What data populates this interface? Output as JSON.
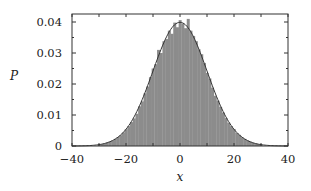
{
  "chart_data": {
    "type": "bar",
    "subtype": "histogram_with_fit",
    "title": "",
    "xlabel": "x",
    "ylabel": "P",
    "xlim": [
      -40,
      40
    ],
    "ylim": [
      0,
      0.042
    ],
    "xticks": [
      -40,
      -20,
      0,
      20,
      40
    ],
    "xtick_labels": [
      "−40",
      "−20",
      "0",
      "20",
      "40"
    ],
    "yticks": [
      0,
      0.01,
      0.02,
      0.03,
      0.04
    ],
    "ytick_labels": [
      "0",
      "0.01",
      "0.02",
      "0.03",
      "0.04"
    ],
    "grid": false,
    "legend": null,
    "histogram": {
      "bin_width": 1,
      "color": "#8c8c8c",
      "x": [
        -30,
        -29,
        -28,
        -27,
        -26,
        -25,
        -24,
        -23,
        -22,
        -21,
        -20,
        -19,
        -18,
        -17,
        -16,
        -15,
        -14,
        -13,
        -12,
        -11,
        -10,
        -9,
        -8,
        -7,
        -6,
        -5,
        -4,
        -3,
        -2,
        -1,
        0,
        1,
        2,
        3,
        4,
        5,
        6,
        7,
        8,
        9,
        10,
        11,
        12,
        13,
        14,
        15,
        16,
        17,
        18,
        19,
        20,
        21,
        22,
        23,
        24,
        25,
        26,
        27,
        28,
        29,
        30
      ],
      "values": [
        0.0005,
        0.0006,
        0.0008,
        0.0011,
        0.0014,
        0.0018,
        0.0023,
        0.0029,
        0.0035,
        0.0044,
        0.0054,
        0.0064,
        0.0077,
        0.0089,
        0.0104,
        0.0128,
        0.0144,
        0.017,
        0.0192,
        0.0222,
        0.025,
        0.0264,
        0.031,
        0.03,
        0.0338,
        0.0345,
        0.0372,
        0.0362,
        0.0398,
        0.0383,
        0.0406,
        0.0395,
        0.038,
        0.041,
        0.0372,
        0.0355,
        0.0338,
        0.0312,
        0.0296,
        0.0268,
        0.0236,
        0.0218,
        0.0188,
        0.0162,
        0.0146,
        0.0126,
        0.0108,
        0.009,
        0.0075,
        0.0064,
        0.0055,
        0.0042,
        0.0036,
        0.0028,
        0.0023,
        0.0018,
        0.0014,
        0.001,
        0.0008,
        0.0006,
        0.0005
      ]
    },
    "fit_curve": {
      "type": "gaussian",
      "mean": 0,
      "sigma": 10,
      "peak": 0.0399,
      "color": "#333333"
    }
  }
}
